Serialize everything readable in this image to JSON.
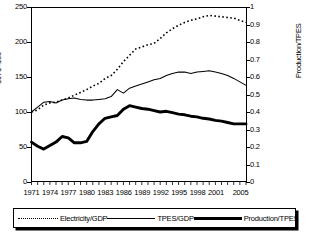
{
  "chart_data": {
    "type": "line",
    "title": "",
    "xlabel": "",
    "ylabel_left": "1971=100",
    "ylabel_right": "Production/TPES",
    "ylim_left": [
      0,
      250
    ],
    "ylim_right": [
      0,
      1
    ],
    "xlim": [
      1971,
      2006
    ],
    "grid": false,
    "legend_position": "bottom",
    "x": [
      1971,
      1972,
      1973,
      1974,
      1975,
      1976,
      1977,
      1978,
      1979,
      1980,
      1981,
      1982,
      1983,
      1984,
      1985,
      1986,
      1987,
      1988,
      1989,
      1990,
      1991,
      1992,
      1993,
      1994,
      1995,
      1996,
      1997,
      1998,
      1999,
      2000,
      2001,
      2002,
      2003,
      2004,
      2005,
      2006
    ],
    "xtick_labels": [
      "1971",
      "1974",
      "1977",
      "1980",
      "1983",
      "1986",
      "1989",
      "1992",
      "1995",
      "1998",
      "2001",
      "2005"
    ],
    "xtick_values": [
      1971,
      1974,
      1977,
      1980,
      1983,
      1986,
      1989,
      1992,
      1995,
      1998,
      2001,
      2005
    ],
    "ytick_labels_left": [
      "0",
      "50",
      "100",
      "150",
      "200",
      "250"
    ],
    "ytick_values_left": [
      0,
      50,
      100,
      150,
      200,
      250
    ],
    "ytick_labels_right": [
      "0",
      "0.1",
      "0.2",
      "0.3",
      "0.4",
      "0.5",
      "0.6",
      "0.7",
      "0.8",
      "0.9",
      "1"
    ],
    "ytick_values_right": [
      0,
      0.1,
      0.2,
      0.3,
      0.4,
      0.5,
      0.6,
      0.7,
      0.8,
      0.9,
      1.0
    ],
    "series": [
      {
        "name": "Electricity/GDP",
        "axis": "left",
        "style": "dotted",
        "values": [
          100,
          103,
          110,
          113,
          114,
          117,
          120,
          124,
          128,
          132,
          137,
          141,
          148,
          152,
          161,
          172,
          181,
          190,
          193,
          196,
          198,
          205,
          213,
          219,
          224,
          228,
          231,
          233,
          236,
          238,
          237,
          236,
          235,
          234,
          231,
          228
        ]
      },
      {
        "name": "TPES/GDP",
        "axis": "left",
        "style": "thin-solid",
        "values": [
          100,
          107,
          114,
          115,
          113,
          117,
          119,
          120,
          118,
          117,
          117,
          118,
          119,
          122,
          132,
          127,
          134,
          137,
          140,
          143,
          146,
          148,
          152,
          155,
          157,
          157,
          155,
          157,
          158,
          159,
          157,
          155,
          152,
          148,
          143,
          138
        ]
      },
      {
        "name": "Production/TPES",
        "axis": "left",
        "style": "thick-solid",
        "values": [
          57,
          51,
          47,
          52,
          57,
          65,
          63,
          56,
          56,
          58,
          72,
          83,
          91,
          93,
          95,
          104,
          109,
          107,
          105,
          104,
          102,
          100,
          101,
          99,
          97,
          96,
          94,
          93,
          91,
          90,
          88,
          87,
          85,
          83,
          83,
          83
        ]
      }
    ]
  },
  "legend": {
    "items": [
      {
        "label": "Electricity/GDP",
        "marker": "dotted-line-swatch"
      },
      {
        "label": "TPES/GDP",
        "marker": "thin-line-swatch"
      },
      {
        "label": "Production/TPES",
        "marker": "thick-line-swatch"
      }
    ]
  }
}
